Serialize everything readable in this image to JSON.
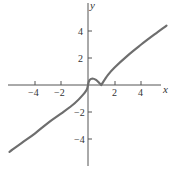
{
  "chart_data": {
    "type": "line",
    "title": "",
    "xlabel": "x",
    "ylabel": "y",
    "xlim": [
      -6,
      5.9
    ],
    "ylim": [
      -6,
      6
    ],
    "grid": false,
    "legend": null,
    "x_ticks": [
      -4,
      -2,
      2,
      4
    ],
    "x_tick_labels": [
      "−4",
      "−2",
      "2",
      "4"
    ],
    "y_ticks": [
      4,
      2,
      -2,
      -4
    ],
    "y_tick_labels": [
      "4",
      "2",
      "−2",
      "−4"
    ],
    "annotations": [
      "local max near x≈0.33",
      "cusp at x=1, y=0",
      "vertical tangent at origin"
    ],
    "series": [
      {
        "name": "f(x)",
        "color": "#6e6e6e",
        "x": [
          -5.9,
          -5,
          -4,
          -3,
          -2,
          -1,
          -0.4,
          -0.1,
          0,
          0.1,
          0.33,
          0.6,
          0.85,
          1,
          1.5,
          2,
          3,
          4,
          5,
          5.9
        ],
        "y": [
          -4.95,
          -4.3,
          -3.6,
          -2.8,
          -2.1,
          -1.35,
          -0.75,
          -0.35,
          0,
          0.35,
          0.48,
          0.38,
          0.15,
          0,
          0.75,
          1.3,
          2.2,
          3.0,
          3.75,
          4.4
        ]
      }
    ]
  },
  "axes": {
    "x_label": "x",
    "y_label": "y",
    "tick_labels": {
      "xn4": "−4",
      "xn2": "−2",
      "x2": "2",
      "x4": "4",
      "y4": "4",
      "y2": "2",
      "yn2": "−2",
      "yn4": "−4"
    }
  },
  "colors": {
    "curve": "#6e6e6e",
    "axes": "#555555",
    "text": "#333333"
  }
}
